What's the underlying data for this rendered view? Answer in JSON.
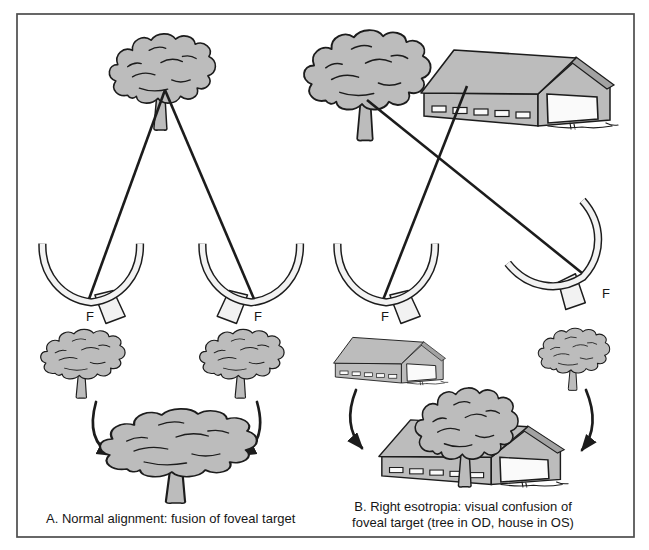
{
  "panelA": {
    "caption": "A. Normal alignment: fusion of foveal target",
    "fovea_label_left": "F",
    "fovea_label_right": "F"
  },
  "panelB": {
    "caption_line1": "B. Right esotropia: visual confusion of",
    "caption_line2": "foveal target (tree in OD, house in OS)",
    "fovea_label_left": "F",
    "fovea_label_right": "F"
  },
  "icons": {
    "tree": "tree-icon",
    "barn": "barn-icon",
    "eye": "retina-cross-section-icon",
    "arrow": "curved-arrow-icon"
  },
  "colors": {
    "background": "#ffffff",
    "frame": "#4d4d4d",
    "object_fill": "#bcbcbc",
    "outline": "#1c1c1c",
    "eye_interior": "#f2f2f2"
  }
}
